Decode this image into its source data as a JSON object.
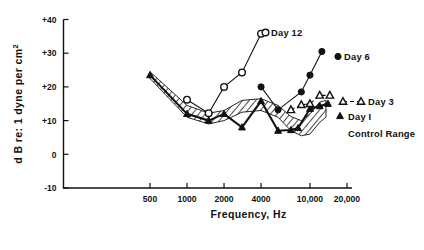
{
  "figure": {
    "background": "#ffffff",
    "ink_color": "#111111"
  },
  "axes": {
    "y_title": "d B re: 1 dyne per cm2",
    "y_title_super": "2",
    "y_title_base": "d B re: 1 dyne per cm",
    "x_title": "Frequency, Hz",
    "y_ticks": [
      "+40",
      "+30",
      "+20",
      "+10",
      "0",
      "-10"
    ],
    "y_tick_values": [
      40,
      30,
      20,
      10,
      0,
      -10
    ],
    "x_ticks": [
      "500",
      "1000",
      "2000",
      "4000",
      "10,000",
      "20,000"
    ],
    "x_tick_values": [
      500,
      1000,
      2000,
      4000,
      10000,
      20000
    ]
  },
  "legend": {
    "day12": "Day 12",
    "day6": "Day 6",
    "day3": "Day 3",
    "day1": "Day I",
    "control": "Control Range"
  },
  "chart_data": {
    "type": "line",
    "title": "",
    "xlabel": "Frequency, Hz",
    "ylabel": "d B re: 1 dyne per cm2",
    "xscale": "log",
    "xlim": [
      400,
      22000
    ],
    "ylim": [
      -10,
      40
    ],
    "xticks": [
      500,
      1000,
      2000,
      4000,
      10000,
      20000
    ],
    "xticklabels": [
      "500",
      "1000",
      "2000",
      "4000",
      "10,000",
      "20,000"
    ],
    "yticks": [
      -10,
      0,
      10,
      20,
      30,
      40
    ],
    "yticklabels": [
      "-10",
      "0",
      "+10",
      "+20",
      "+30",
      "+40"
    ],
    "grid": false,
    "legend_position": "inline-right",
    "series": [
      {
        "name": "Day I",
        "marker": "filled-triangle",
        "line": "thick-solid",
        "x": [
          500,
          1000,
          1500,
          2000,
          2800,
          4000,
          5500,
          7000,
          8000,
          10000,
          12000,
          14000
        ],
        "y": [
          23.5,
          12.0,
          10.0,
          12.0,
          8.0,
          15.8,
          7.0,
          7.2,
          7.8,
          13.5,
          14.3,
          15.0
        ]
      },
      {
        "name": "Day 3",
        "marker": "open-triangle",
        "line": "thin-dashed",
        "x": [
          7000,
          8500,
          10000,
          12000,
          14500
        ],
        "y": [
          13.2,
          14.7,
          15.0,
          17.5,
          17.5
        ]
      },
      {
        "name": "Day 6",
        "marker": "filled-circle",
        "line": "thin-solid",
        "x": [
          4000,
          5500,
          8500,
          10000,
          12500
        ],
        "y": [
          20.0,
          13.2,
          18.5,
          23.5,
          30.5
        ]
      },
      {
        "name": "Day 12",
        "marker": "open-circle",
        "line": "thin-solid",
        "x": [
          1000,
          1500,
          2000,
          2800,
          4000
        ],
        "y": [
          16.2,
          12.2,
          20.0,
          24.3,
          35.8
        ]
      }
    ],
    "band": {
      "name": "Control Range",
      "fill": "diagonal-hatch",
      "x": [
        500,
        1000,
        1500,
        2000,
        2800,
        4000,
        5500,
        7000,
        8500,
        10000,
        12000,
        13500
      ],
      "y_upper": [
        24.5,
        14.5,
        12.2,
        13.0,
        16.0,
        16.5,
        14.5,
        11.2,
        10.0,
        12.0,
        15.5,
        16.0
      ],
      "y_lower": [
        22.5,
        11.0,
        9.0,
        10.0,
        12.5,
        13.0,
        11.0,
        7.0,
        5.5,
        6.0,
        9.5,
        11.0
      ]
    }
  }
}
